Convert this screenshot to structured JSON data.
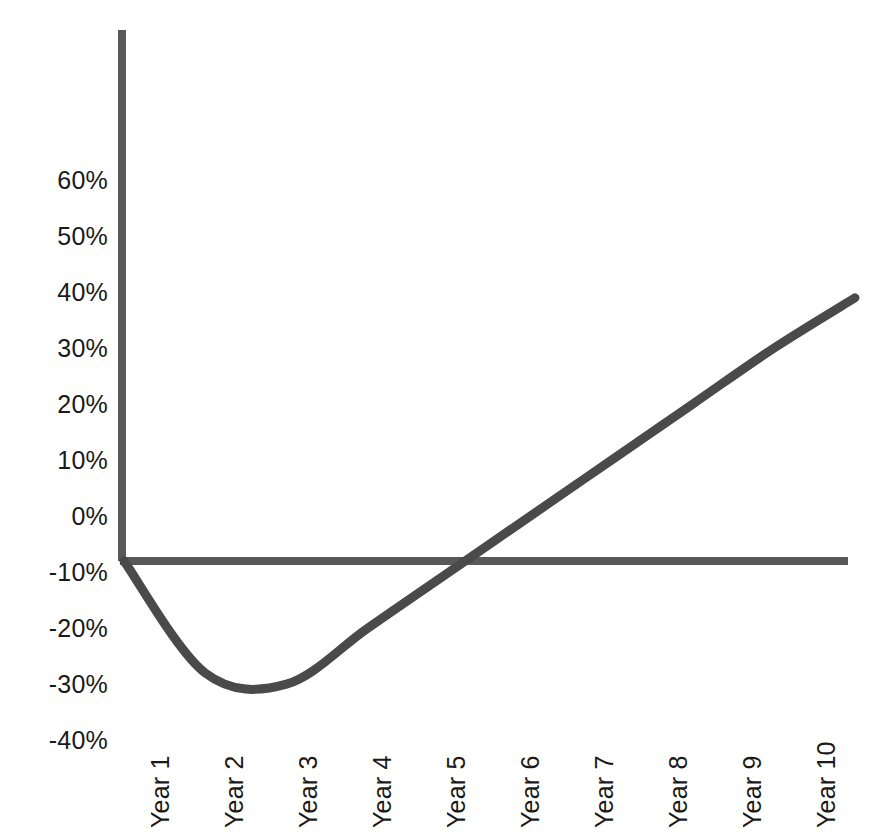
{
  "chart_data": {
    "type": "line",
    "title": "",
    "subtitle": "",
    "xlabel": "",
    "ylabel": "",
    "categories": [
      "Year 1",
      "Year 2",
      "Year 3",
      "Year 4",
      "Year 5",
      "Year 6",
      "Year 7",
      "Year 8",
      "Year 9",
      "Year 10"
    ],
    "x": [
      1,
      2,
      3,
      4,
      5,
      6,
      7,
      8,
      9,
      10
    ],
    "series": [
      {
        "name": "Return",
        "values": [
          0,
          -20,
          -22,
          -12,
          -2,
          8,
          18,
          28,
          38,
          47
        ]
      }
    ],
    "ytick_labels": [
      "60%",
      "50%",
      "40%",
      "30%",
      "20%",
      "10%",
      "0%",
      "-10%",
      "-20%",
      "-30%",
      "-40%"
    ],
    "ytick_values": [
      60,
      50,
      40,
      30,
      20,
      10,
      0,
      -10,
      -20,
      -30,
      -40
    ],
    "ylim": [
      -40,
      70
    ],
    "xlim": [
      1,
      10
    ],
    "grid": false,
    "legend": false,
    "legend_position": "none",
    "zero_line": true,
    "annotations": [
      {
        "label": "minimum",
        "x": 2.3,
        "y": -23
      },
      {
        "label": "break-even crossing",
        "x": 5.5,
        "y": 0
      }
    ]
  },
  "style": {
    "background": "#ffffff",
    "curve_color": "#4a4a4a",
    "axis_color": "#595959",
    "text_color": "#1a1a1a",
    "curve_width": 9,
    "axis_width": 8
  }
}
